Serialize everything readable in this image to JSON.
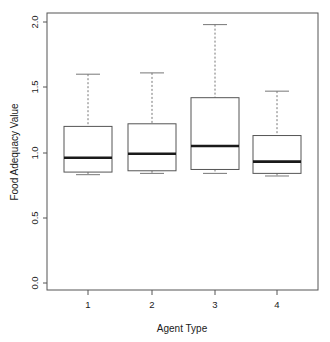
{
  "chart_data": {
    "type": "box",
    "title": "",
    "xlabel": "Agent Type",
    "ylabel": "Food Adequacy Value",
    "categories": [
      "1",
      "2",
      "3",
      "4"
    ],
    "xtick_labels": [
      "1",
      "2",
      "3",
      "4"
    ],
    "ytick_labels": [
      "0.0",
      "0.5",
      "1.0",
      "1.5",
      "2.0"
    ],
    "ytick_values": [
      0.0,
      0.5,
      1.0,
      1.5,
      2.0
    ],
    "ylim": [
      -0.04,
      2.07
    ],
    "grid": false,
    "legend": false,
    "boxes": [
      {
        "category": "1",
        "whisker_low": 0.83,
        "q1": 0.85,
        "median": 0.96,
        "q3": 1.2,
        "whisker_high": 1.6
      },
      {
        "category": "2",
        "whisker_low": 0.84,
        "q1": 0.86,
        "median": 0.99,
        "q3": 1.22,
        "whisker_high": 1.61
      },
      {
        "category": "3",
        "whisker_low": 0.84,
        "q1": 0.87,
        "median": 1.05,
        "q3": 1.42,
        "whisker_high": 1.98
      },
      {
        "category": "4",
        "whisker_low": 0.82,
        "q1": 0.84,
        "median": 0.93,
        "q3": 1.13,
        "whisker_high": 1.47
      }
    ],
    "colors": {
      "box_fill": "#ffffff",
      "box_stroke": "#555555",
      "median": "#1a1a1a",
      "whisker": "#777777",
      "frame": "#555555",
      "text": "#1a1a1a",
      "background": "#ffffff"
    }
  }
}
